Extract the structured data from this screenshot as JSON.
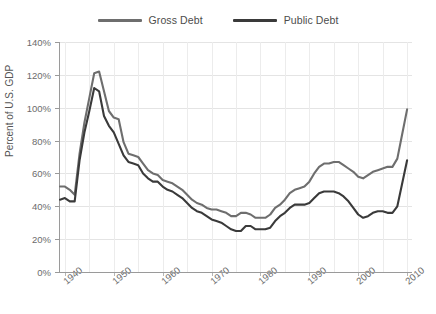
{
  "chart_data": {
    "type": "line",
    "title": "",
    "xlabel": "",
    "ylabel": "Percent of U.S. GDP",
    "xlim": [
      1939,
      2011
    ],
    "ylim": [
      0,
      140
    ],
    "ytick_labels": [
      "0%",
      "20%",
      "40%",
      "60%",
      "80%",
      "100%",
      "120%",
      "140%"
    ],
    "ytick_values": [
      0,
      20,
      40,
      60,
      80,
      100,
      120,
      140
    ],
    "xtick_labels": [
      "1940",
      "1950",
      "1960",
      "1970",
      "1980",
      "1990",
      "2000",
      "2010"
    ],
    "xtick_values": [
      1940,
      1950,
      1960,
      1970,
      1980,
      1990,
      2000,
      2010
    ],
    "grid": true,
    "legend_position": "top-center",
    "x": [
      1939,
      1940,
      1941,
      1942,
      1943,
      1944,
      1945,
      1946,
      1947,
      1948,
      1949,
      1950,
      1951,
      1952,
      1953,
      1954,
      1955,
      1956,
      1957,
      1958,
      1959,
      1960,
      1961,
      1962,
      1963,
      1964,
      1965,
      1966,
      1967,
      1968,
      1969,
      1970,
      1971,
      1972,
      1973,
      1974,
      1975,
      1976,
      1977,
      1978,
      1979,
      1980,
      1981,
      1982,
      1983,
      1984,
      1985,
      1986,
      1987,
      1988,
      1989,
      1990,
      1991,
      1992,
      1993,
      1994,
      1995,
      1996,
      1997,
      1998,
      1999,
      2000,
      2001,
      2002,
      2003,
      2004,
      2005,
      2006,
      2007,
      2008,
      2009,
      2010
    ],
    "series": [
      {
        "name": "Gross Debt",
        "color": "#6e6e6e",
        "values": [
          52,
          52,
          50,
          47,
          72,
          91,
          106,
          121,
          122,
          110,
          98,
          94,
          93,
          79,
          72,
          71,
          70,
          66,
          62,
          60,
          59,
          56,
          55,
          54,
          52,
          50,
          47,
          44,
          42,
          41,
          39,
          38,
          38,
          37,
          36,
          34,
          34,
          36,
          36,
          35,
          33,
          33,
          33,
          35,
          39,
          41,
          44,
          48,
          50,
          51,
          52,
          55,
          60,
          64,
          66,
          66,
          67,
          67,
          65,
          63,
          61,
          58,
          57,
          59,
          61,
          62,
          63,
          64,
          64,
          69,
          84,
          99
        ]
      },
      {
        "name": "Public Debt",
        "color": "#3a3a3a",
        "values": [
          44,
          45,
          43,
          43,
          68,
          85,
          98,
          112,
          110,
          95,
          89,
          85,
          78,
          71,
          67,
          66,
          65,
          60,
          57,
          55,
          55,
          52,
          50,
          49,
          47,
          45,
          42,
          39,
          37,
          36,
          34,
          32,
          31,
          30,
          28,
          26,
          25,
          25,
          28,
          28,
          26,
          26,
          26,
          27,
          31,
          34,
          36,
          39,
          41,
          41,
          41,
          42,
          45,
          48,
          49,
          49,
          49,
          48,
          46,
          43,
          39,
          35,
          33,
          34,
          36,
          37,
          37,
          36,
          36,
          40,
          54,
          68
        ]
      }
    ]
  },
  "legend": {
    "items": [
      {
        "label": "Gross Debt"
      },
      {
        "label": "Public Debt"
      }
    ]
  }
}
